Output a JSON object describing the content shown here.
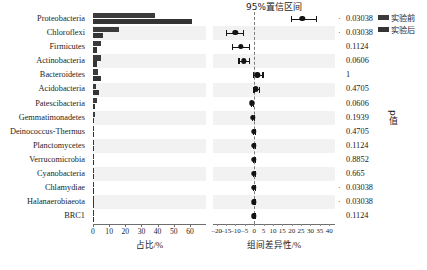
{
  "chart_data": {
    "type": "bar",
    "title": "",
    "panels": [
      {
        "name": "abundance",
        "type": "bar",
        "orientation": "horizontal",
        "xlabel": "占比/%",
        "ylabel": "",
        "xlim": [
          0,
          65
        ],
        "xticks": [
          0,
          10,
          20,
          30,
          40,
          50,
          60
        ],
        "xticklabels": [
          "0",
          "10",
          "20",
          "30",
          "40",
          "50",
          "60"
        ],
        "grid": false
      },
      {
        "name": "confidence-interval",
        "type": "scatter",
        "title": "95%置信区间",
        "xlabel": "组间差异性/%",
        "xlim": [
          -22,
          41
        ],
        "xticks": [
          -20,
          -15,
          -10,
          -5,
          0,
          5,
          10,
          15,
          20,
          25,
          30,
          35,
          40
        ],
        "xticklabels": [
          "–20",
          "–15",
          "–10",
          "–5",
          "0",
          "5",
          "10",
          "15",
          "20",
          "25",
          "30",
          "35",
          "40"
        ],
        "zero_reference_line": 0,
        "grid": false
      },
      {
        "name": "p-value",
        "type": "table",
        "ylabel": "p值"
      }
    ],
    "categories": [
      "Proteobacteria",
      "Chloroflexi",
      "Firmicutes",
      "Actinobacteria",
      "Bacteroidetes",
      "Acidobacteria",
      "Patescibacteria",
      "Gemmatimonadetes",
      "Deinococcus-Thermus",
      "Planctomycetes",
      "Verrucomicrobia",
      "Cyanobacteria",
      "Chlamydiae",
      "Halanaerobiaeota",
      "BRC1"
    ],
    "series": [
      {
        "name": "实验前",
        "color": "#3b3b3b",
        "values": [
          38.1,
          16.2,
          5.1,
          5.2,
          3.4,
          2.0,
          2.6,
          1.5,
          0.5,
          0.35,
          0.3,
          0.2,
          0.15,
          0.12,
          0.1
        ]
      },
      {
        "name": "实验后",
        "color": "#343434",
        "values": [
          61.0,
          6.1,
          2.6,
          2.7,
          5.2,
          3.5,
          1.4,
          0.7,
          0.45,
          0.3,
          0.25,
          0.3,
          0.15,
          0.12,
          0.1
        ]
      }
    ],
    "ci": [
      {
        "category": "Proteobacteria",
        "diff": 25.6,
        "low": 19.7,
        "high": 33.2,
        "p": "0.03038",
        "significant": true
      },
      {
        "category": "Chloroflexi",
        "diff": -10.1,
        "low": -15.1,
        "high": -6.2,
        "p": "0.03038",
        "significant": true
      },
      {
        "category": "Firmicutes",
        "diff": -7.3,
        "low": -11.8,
        "high": -3.0,
        "p": "0.1124",
        "significant": false
      },
      {
        "category": "Actinobacteria",
        "diff": -5.5,
        "low": -8.4,
        "high": -2.9,
        "p": "0.0606",
        "significant": false
      },
      {
        "category": "Bacteroidetes",
        "diff": 1.7,
        "low": -0.6,
        "high": 4.4,
        "p": "1",
        "significant": false
      },
      {
        "category": "Acidobacteria",
        "diff": 1.0,
        "low": -0.4,
        "high": 2.3,
        "p": "0.4705",
        "significant": false
      },
      {
        "category": "Patescibacteria",
        "diff": -1.2,
        "low": -1.9,
        "high": -0.5,
        "p": "0.0606",
        "significant": false
      },
      {
        "category": "Gemmatimonadetes",
        "diff": -0.8,
        "low": -1.3,
        "high": -0.3,
        "p": "0.1939",
        "significant": false
      },
      {
        "category": "Deinococcus-Thermus",
        "diff": -0.1,
        "low": -0.5,
        "high": 0.4,
        "p": "0.4705",
        "significant": false
      },
      {
        "category": "Planctomycetes",
        "diff": -0.1,
        "low": -0.5,
        "high": 0.3,
        "p": "0.1124",
        "significant": false
      },
      {
        "category": "Verrucomicrobia",
        "diff": -0.1,
        "low": -0.6,
        "high": 0.4,
        "p": "0.8852",
        "significant": false
      },
      {
        "category": "Cyanobacteria",
        "diff": -0.1,
        "low": -0.5,
        "high": 0.3,
        "p": "0.665",
        "significant": false
      },
      {
        "category": "Chlamydiae",
        "diff": -0.2,
        "low": -0.6,
        "high": 0.2,
        "p": "0.03038",
        "significant": true
      },
      {
        "category": "Halanaerobiaeota",
        "diff": -0.1,
        "low": -0.4,
        "high": 0.2,
        "p": "0.03038",
        "significant": true
      },
      {
        "category": "BRC1",
        "diff": -0.1,
        "low": -0.4,
        "high": 0.3,
        "p": "0.1124",
        "significant": false
      }
    ]
  },
  "legend": {
    "position": "top-right",
    "items": [
      {
        "label": "实验前",
        "color": "#3b3b3b"
      },
      {
        "label": "实验后",
        "color": "#343434"
      }
    ]
  },
  "significance_marker": "·"
}
